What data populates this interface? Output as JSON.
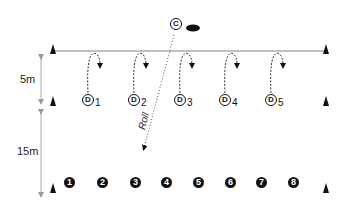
{
  "diagram": {
    "type": "drill-layout",
    "colors": {
      "line": "#aaaaaa",
      "ink": "#111111",
      "dim_arrow": "#999999"
    },
    "distances": [
      {
        "label": "5m",
        "from_y": 55,
        "to_y": 103
      },
      {
        "label": "15m",
        "from_y": 110,
        "to_y": 196
      }
    ],
    "coach": {
      "label": "C",
      "x": 176,
      "y": 24
    },
    "ball": {
      "x": 193,
      "y": 28
    },
    "roll_label": "Roll",
    "defenders": [
      {
        "letter": "D",
        "sub": "1",
        "x": 84
      },
      {
        "letter": "D",
        "sub": "2",
        "x": 130
      },
      {
        "letter": "D",
        "sub": "3",
        "x": 176
      },
      {
        "letter": "D",
        "sub": "4",
        "x": 221
      },
      {
        "letter": "D",
        "sub": "5",
        "x": 267
      }
    ],
    "players": [
      {
        "n": "1",
        "x": 64
      },
      {
        "n": "2",
        "x": 97
      },
      {
        "n": "3",
        "x": 130
      },
      {
        "n": "4",
        "x": 161
      },
      {
        "n": "5",
        "x": 193
      },
      {
        "n": "6",
        "x": 225
      },
      {
        "n": "7",
        "x": 256
      },
      {
        "n": "8",
        "x": 288
      }
    ],
    "cones": [
      {
        "x": 53,
        "y": 48
      },
      {
        "x": 326,
        "y": 48
      },
      {
        "x": 53,
        "y": 100
      },
      {
        "x": 326,
        "y": 100
      },
      {
        "x": 53,
        "y": 187
      },
      {
        "x": 326,
        "y": 187
      }
    ]
  }
}
